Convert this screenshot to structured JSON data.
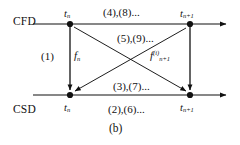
{
  "figure": {
    "caption": "(b)",
    "type": "staggered-coupling-timeline-diagram",
    "ink_color": "#111111",
    "background_color": "#ffffff"
  },
  "rows": [
    {
      "id": "cfd",
      "label": "CFD",
      "y": 24
    },
    {
      "id": "csd",
      "label": "CSD",
      "y": 95
    }
  ],
  "time_nodes": [
    {
      "id": "cfd-tn",
      "row": "cfd",
      "label_main": "t",
      "label_sub": "n",
      "x": 70,
      "y": 24
    },
    {
      "id": "cfd-tn1",
      "row": "cfd",
      "label_main": "t",
      "label_sub": "n+1",
      "x": 190,
      "y": 24
    },
    {
      "id": "csd-tn",
      "row": "csd",
      "label_main": "t",
      "label_sub": "n",
      "x": 70,
      "y": 95
    },
    {
      "id": "csd-tn1",
      "row": "csd",
      "label_main": "t",
      "label_sub": "n+1",
      "x": 190,
      "y": 95
    }
  ],
  "annotations": {
    "top_edge": "(4),(8)...",
    "upper_middle": "(5),(9)...",
    "lower_middle": "(3),(7)...",
    "bottom_edge": "(2),(6)...",
    "left_vertical_step": "(1)"
  },
  "force_symbols": {
    "left": {
      "base": "f",
      "sub": "n",
      "sup": ""
    },
    "right": {
      "base": "f",
      "sub": "n+1",
      "sup": "(i)"
    }
  }
}
